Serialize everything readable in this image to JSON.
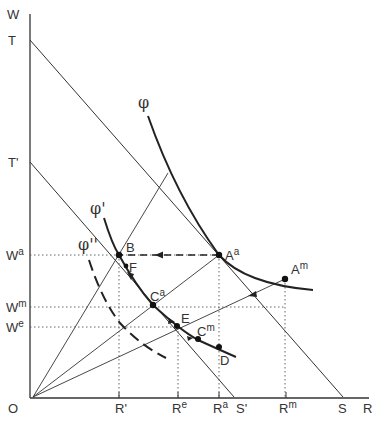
{
  "axes": {
    "y_label": "W",
    "x_label": "R",
    "origin_label": "O"
  },
  "y_intercepts": [
    {
      "label": "T",
      "sup": ""
    },
    {
      "label": "T",
      "sup": "'"
    }
  ],
  "x_intercepts": [
    {
      "label": "S",
      "sup": ""
    },
    {
      "label": "S",
      "sup": "'"
    }
  ],
  "y_ticks": [
    {
      "label": "W",
      "sup": "a"
    },
    {
      "label": "W",
      "sup": "m"
    },
    {
      "label": "W",
      "sup": "e"
    }
  ],
  "x_ticks": [
    {
      "label": "R",
      "sup": "'"
    },
    {
      "label": "R",
      "sup": "e"
    },
    {
      "label": "R",
      "sup": "a"
    },
    {
      "label": "R",
      "sup": "m"
    }
  ],
  "curves": [
    {
      "label": "φ",
      "style": "solid-thick"
    },
    {
      "label": "φ'",
      "style": "solid-thick"
    },
    {
      "label": "φ''",
      "style": "dashed-thick"
    }
  ],
  "points": [
    {
      "label": "A",
      "sup": "a"
    },
    {
      "label": "A",
      "sup": "m"
    },
    {
      "label": "B",
      "sup": ""
    },
    {
      "label": "F",
      "sup": ""
    },
    {
      "label": "C",
      "sup": "a"
    },
    {
      "label": "E",
      "sup": ""
    },
    {
      "label": "C",
      "sup": "m"
    },
    {
      "label": "D",
      "sup": ""
    }
  ],
  "colors": {
    "line": "#333333",
    "curve": "#222222",
    "guide": "#555555",
    "background": "#ffffff"
  }
}
